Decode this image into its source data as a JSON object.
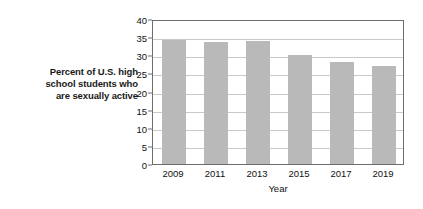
{
  "caption": {
    "lines": [
      "Percent of U.S. high",
      "school students who",
      "are sexually active"
    ]
  },
  "colors": {
    "bar_fill": "#b9b9b9",
    "frame": "#6e6e6e",
    "gridline": "#c9c9c9",
    "background": "#ffffff",
    "text": "#111111"
  },
  "chart_data": {
    "type": "bar",
    "title": "",
    "xlabel": "Year",
    "ylabel": "Percent of U.S. high school students who are sexually active",
    "categories": [
      "2009",
      "2011",
      "2013",
      "2015",
      "2017",
      "2019"
    ],
    "values": [
      34.2,
      33.6,
      33.9,
      30.1,
      28.2,
      27.0
    ],
    "ylim": [
      0,
      40
    ],
    "yticks": [
      "0",
      "5",
      "10",
      "15",
      "20",
      "25",
      "30",
      "35",
      "40"
    ],
    "ytick_values": [
      0,
      5,
      10,
      15,
      20,
      25,
      30,
      35,
      40
    ],
    "grid": "horizontal",
    "legend": "none"
  }
}
